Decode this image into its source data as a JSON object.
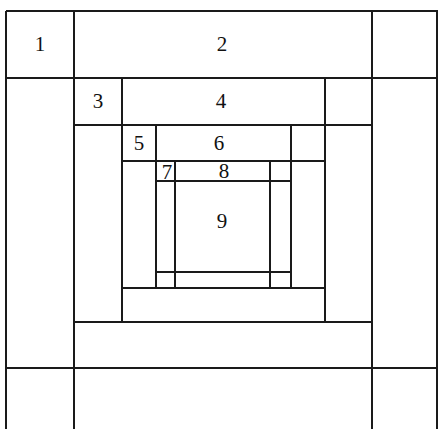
{
  "figure": {
    "title": "",
    "type": "nested-spiral-rectangle-subdivision",
    "background_color": "#ffffff",
    "line_color": "#1a1a1a",
    "line_width_px": 2,
    "width_px": 444,
    "height_px": 429,
    "note_cropped_bottom": true
  },
  "labels": [
    {
      "text": "1",
      "x": 40,
      "y": 44
    },
    {
      "text": "2",
      "x": 222,
      "y": 44
    },
    {
      "text": "3",
      "x": 98,
      "y": 101
    },
    {
      "text": "4",
      "x": 221,
      "y": 101
    },
    {
      "text": "5",
      "x": 139,
      "y": 143
    },
    {
      "text": "6",
      "x": 219,
      "y": 143
    },
    {
      "text": "7",
      "x": 167,
      "y": 172
    },
    {
      "text": "8",
      "x": 224,
      "y": 171
    },
    {
      "text": "9",
      "x": 222,
      "y": 221
    }
  ],
  "horizontal_lines": [
    {
      "name": "outer-top",
      "x1": 6,
      "x2": 438,
      "y": 11
    },
    {
      "name": "ring1-bottom",
      "x1": 6,
      "x2": 438,
      "y": 78
    },
    {
      "name": "ring2-top",
      "x1": 74,
      "x2": 372,
      "y": 78
    },
    {
      "name": "ring2-bottom",
      "x1": 74,
      "x2": 372,
      "y": 125
    },
    {
      "name": "ring3-top",
      "x1": 122,
      "x2": 325,
      "y": 125
    },
    {
      "name": "ring3-bottom",
      "x1": 122,
      "x2": 325,
      "y": 161
    },
    {
      "name": "ring4-top",
      "x1": 156,
      "x2": 291,
      "y": 161
    },
    {
      "name": "ring4-bottom",
      "x1": 156,
      "x2": 291,
      "y": 181
    },
    {
      "name": "ring4-inner-bot",
      "x1": 156,
      "x2": 291,
      "y": 272
    },
    {
      "name": "ring3-lower",
      "x1": 122,
      "x2": 325,
      "y": 288
    },
    {
      "name": "ring2-lower",
      "x1": 74,
      "x2": 372,
      "y": 322
    },
    {
      "name": "ring1-lower",
      "x1": 6,
      "x2": 438,
      "y": 368
    }
  ],
  "vertical_lines": [
    {
      "name": "outer-left",
      "y1": 11,
      "y2": 429,
      "x": 6
    },
    {
      "name": "col-a",
      "y1": 11,
      "y2": 429,
      "x": 74
    },
    {
      "name": "ring2-left",
      "y1": 78,
      "y2": 322,
      "x": 122
    },
    {
      "name": "ring3-left",
      "y1": 125,
      "y2": 288,
      "x": 156
    },
    {
      "name": "ring4-left",
      "y1": 161,
      "y2": 288,
      "x": 175
    },
    {
      "name": "ring4-right",
      "y1": 161,
      "y2": 288,
      "x": 270
    },
    {
      "name": "ring3-right",
      "y1": 125,
      "y2": 288,
      "x": 291
    },
    {
      "name": "ring2-right",
      "y1": 78,
      "y2": 322,
      "x": 325
    },
    {
      "name": "col-b",
      "y1": 11,
      "y2": 429,
      "x": 372
    },
    {
      "name": "outer-right",
      "y1": 11,
      "y2": 429,
      "x": 437
    }
  ]
}
